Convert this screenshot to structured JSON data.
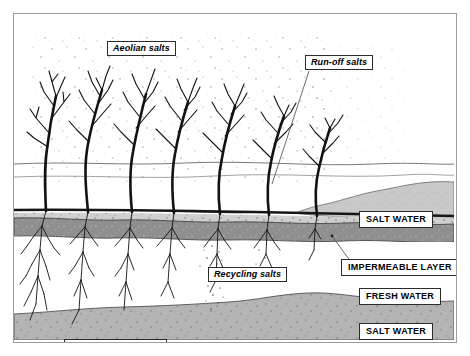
{
  "diagram": {
    "labels": {
      "aeolian": "Aeolian salts",
      "runoff": "Run-off salts",
      "recycling": "Recycling salts",
      "roots": "Roots \"mining\" salts",
      "salt_water_upper": "SALT WATER",
      "impermeable_layer": "IMPERMEABLE LAYER",
      "fresh_water": "FRESH WATER",
      "salt_water_lower": "SALT WATER"
    },
    "colors": {
      "background": "#ffffff",
      "frame_border": "#9c9c9c",
      "ink": "#1a1a1a",
      "salt_water_wedge": "#c9c9c9",
      "impermeable_layer": "#8f8f8f",
      "deep_salt_water": "#b4b4b4",
      "label_border": "#2b2b2b",
      "leader_line": "#555555",
      "horizon_line": "#6e6e6e"
    },
    "layers": [
      {
        "name": "air",
        "description": "sky with wind-blown salt stipple"
      },
      {
        "name": "shrub-row",
        "description": "seven leafless shrubs rooted at ground line"
      },
      {
        "name": "ground-surface",
        "description": "bold dark ground line across scene"
      },
      {
        "name": "salt-water-wedge",
        "description": "light grey saline wedge intruding from right"
      },
      {
        "name": "impermeable-layer",
        "description": "mid-grey impermeable band below surface"
      },
      {
        "name": "fresh-water",
        "description": "white unsaturated fresh water zone"
      },
      {
        "name": "deep-salt-water",
        "description": "grey deep saline groundwater at base"
      }
    ]
  }
}
